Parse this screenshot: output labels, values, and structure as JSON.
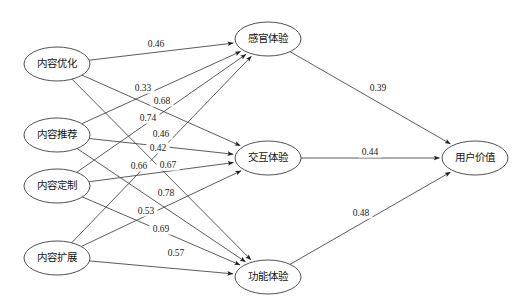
{
  "diagram": {
    "type": "path-diagram",
    "title": "",
    "colors": {
      "edge": "#4a4a4a",
      "node_stroke": "#3c3c3c",
      "node_fill": "#ffffff",
      "text": "#151515",
      "background": "#ffffff"
    },
    "layers": [
      {
        "name": "exogenous-layer",
        "nodes": [
          {
            "id": "n1",
            "label": "内容优化",
            "x": 57,
            "y": 64,
            "rx": 33,
            "ry": 17
          },
          {
            "id": "n2",
            "label": "内容推荐",
            "x": 57,
            "y": 135,
            "rx": 33,
            "ry": 17
          },
          {
            "id": "n3",
            "label": "内容定制",
            "x": 57,
            "y": 186,
            "rx": 33,
            "ry": 17
          },
          {
            "id": "n4",
            "label": "内容扩展",
            "x": 57,
            "y": 258,
            "rx": 33,
            "ry": 17
          }
        ]
      },
      {
        "name": "mediator-layer",
        "nodes": [
          {
            "id": "m1",
            "label": "感官体验",
            "x": 268,
            "y": 39,
            "rx": 33,
            "ry": 17
          },
          {
            "id": "m2",
            "label": "交互体验",
            "x": 268,
            "y": 158,
            "rx": 33,
            "ry": 17
          },
          {
            "id": "m3",
            "label": "功能体验",
            "x": 268,
            "y": 277,
            "rx": 33,
            "ry": 17
          }
        ]
      },
      {
        "name": "outcome-layer",
        "nodes": [
          {
            "id": "o1",
            "label": "用户价值",
            "x": 475,
            "y": 158,
            "rx": 33,
            "ry": 17
          }
        ]
      }
    ],
    "edges": [
      {
        "from": "n1",
        "to": "m1",
        "weight": "0.46",
        "lx": 156,
        "ly": 44
      },
      {
        "from": "n1",
        "to": "m2",
        "weight": "0.33",
        "lx": 143,
        "ly": 88
      },
      {
        "from": "n1",
        "to": "m3",
        "weight": "0.53",
        "lx": 146,
        "ly": 211
      },
      {
        "from": "n2",
        "to": "m1",
        "weight": "0.68",
        "lx": 162,
        "ly": 101
      },
      {
        "from": "n2",
        "to": "m2",
        "weight": "0.46",
        "lx": 161,
        "ly": 134
      },
      {
        "from": "n2",
        "to": "m3",
        "weight": "0.69",
        "lx": 161,
        "ly": 229
      },
      {
        "from": "n3",
        "to": "m1",
        "weight": "0.74",
        "lx": 148,
        "ly": 118
      },
      {
        "from": "n3",
        "to": "m2",
        "weight": "0.67",
        "lx": 168,
        "ly": 165
      },
      {
        "from": "n3",
        "to": "m3",
        "weight": "0.78",
        "lx": 166,
        "ly": 193
      },
      {
        "from": "n4",
        "to": "m1",
        "weight": "0.42",
        "lx": 158,
        "ly": 148
      },
      {
        "from": "n4",
        "to": "m2",
        "weight": "0.66",
        "lx": 139,
        "ly": 166
      },
      {
        "from": "n4",
        "to": "m3",
        "weight": "0.57",
        "lx": 176,
        "ly": 253
      },
      {
        "from": "m1",
        "to": "o1",
        "weight": "0.39",
        "lx": 378,
        "ly": 88
      },
      {
        "from": "m2",
        "to": "o1",
        "weight": "0.44",
        "lx": 370,
        "ly": 152
      },
      {
        "from": "m3",
        "to": "o1",
        "weight": "0.48",
        "lx": 361,
        "ly": 213
      }
    ]
  }
}
